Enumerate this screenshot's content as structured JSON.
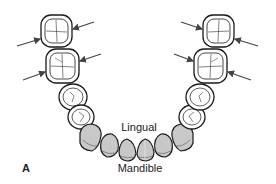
{
  "figure": {
    "panel_label": "A",
    "labels": {
      "lingual": "Lingual",
      "mandible": "Mandible"
    },
    "colors": {
      "outline": "#1a1a1a",
      "anterior_fill": "#c8c8c8",
      "posterior_fill": "#ffffff",
      "arrow": "#444444"
    },
    "teeth": {
      "posterior_left": [
        "molar-2",
        "molar-1",
        "premolar-2",
        "premolar-1"
      ],
      "anterior": [
        "canine-left",
        "lateral-incisor-left",
        "central-incisor-left",
        "central-incisor-right",
        "lateral-incisor-right",
        "canine-right"
      ],
      "posterior_right": [
        "premolar-1",
        "premolar-2",
        "molar-1",
        "molar-2"
      ]
    },
    "arrows": {
      "count": 8,
      "description": "Arrows pointing at proximal contact areas of molars"
    }
  }
}
